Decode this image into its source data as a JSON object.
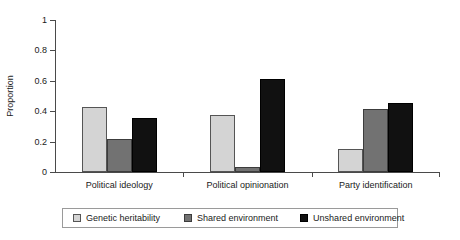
{
  "chart_data": {
    "type": "bar",
    "title": "",
    "xlabel": "",
    "ylabel": "Proportion",
    "ylim": [
      0,
      1
    ],
    "yticks": [
      "0",
      "0.2",
      "0.4",
      "0.6",
      "0.8",
      "1"
    ],
    "ytick_values": [
      0,
      0.2,
      0.4,
      0.6,
      0.8,
      1
    ],
    "grid": false,
    "legend_position": "bottom",
    "categories": [
      "Political ideology",
      "Political opinionation",
      "Party identification"
    ],
    "series": [
      {
        "name": "Genetic heritability",
        "color": "#d4d4d4",
        "values": [
          0.43,
          0.375,
          0.15
        ]
      },
      {
        "name": "Shared environment",
        "color": "#727272",
        "values": [
          0.22,
          0.03,
          0.415
        ]
      },
      {
        "name": "Unshared environment",
        "color": "#111111",
        "values": [
          0.355,
          0.615,
          0.455
        ]
      }
    ]
  },
  "legend": {
    "items": [
      {
        "label": "Genetic heritability"
      },
      {
        "label": "Shared environment"
      },
      {
        "label": "Unshared environment"
      }
    ]
  }
}
